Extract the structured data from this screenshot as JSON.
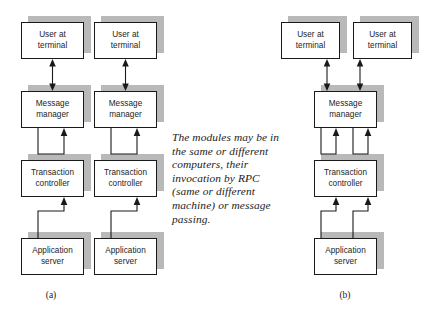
{
  "figure": {
    "note": "The modules may be in\nthe same or different\ncomputers, their\ninvocation by RPC\n(same or different\nmachine) or message\npassing.",
    "colors": {
      "background": "#ffffff",
      "box_fill": "#ffffff",
      "box_border": "#1a1a1a",
      "shadow": "#b9b9b9",
      "text": "#1c1c1c"
    }
  },
  "panel_a": {
    "caption": "(a)",
    "columns": [
      {
        "nodes": [
          {
            "id": "user-terminal",
            "label": "User at\nterminal"
          },
          {
            "id": "message-manager",
            "label": "Message\nmanager"
          },
          {
            "id": "transaction-controller",
            "label": "Transaction\ncontroller"
          },
          {
            "id": "application-server",
            "label": "Application\nserver"
          }
        ]
      },
      {
        "nodes": [
          {
            "id": "user-terminal",
            "label": "User at\nterminal"
          },
          {
            "id": "message-manager",
            "label": "Message\nmanager"
          },
          {
            "id": "transaction-controller",
            "label": "Transaction\ncontroller"
          },
          {
            "id": "application-server",
            "label": "Application\nserver"
          }
        ]
      }
    ]
  },
  "panel_b": {
    "caption": "(b)",
    "terminals": [
      {
        "id": "user-terminal",
        "label": "User at\nterminal"
      },
      {
        "id": "user-terminal",
        "label": "User at\nterminal"
      }
    ],
    "stack": [
      {
        "id": "message-manager",
        "label": "Message\nmanager"
      },
      {
        "id": "transaction-controller",
        "label": "Transaction\ncontroller"
      },
      {
        "id": "application-server",
        "label": "Application\nserver"
      }
    ]
  }
}
